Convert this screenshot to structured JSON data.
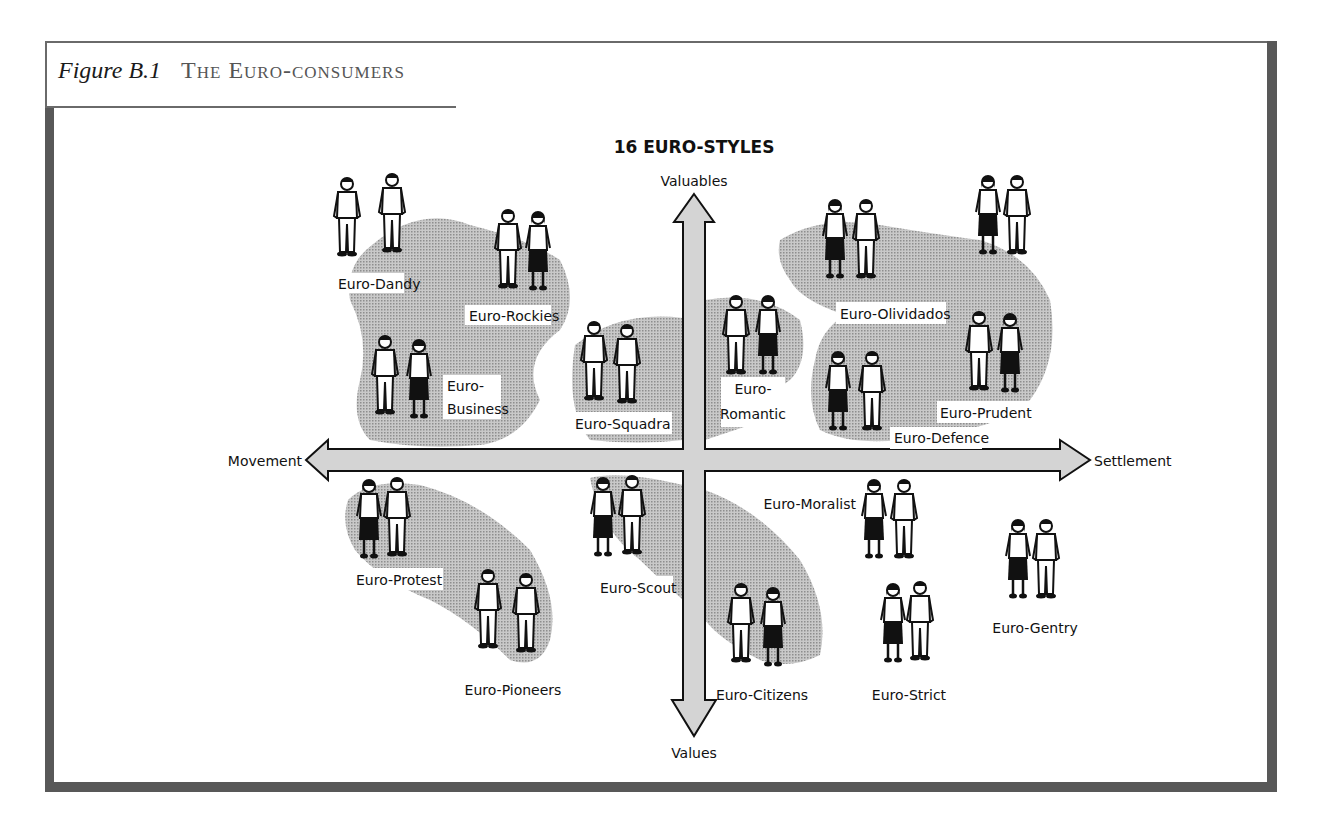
{
  "figure": {
    "number": "Figure B.1",
    "title": "The Euro-consumers"
  },
  "diagram": {
    "title": "16 EURO-STYLES",
    "axes": {
      "top": "Valuables",
      "bottom": "Values",
      "left": "Movement",
      "right": "Settlement"
    },
    "colors": {
      "arrow_fill": "#d4d4d4",
      "arrow_stroke": "#111111",
      "blob_fill": "#b5b5b5",
      "frame": "#585858"
    },
    "groups": [
      {
        "label": "Euro-Dandy",
        "quadrant": "top-left"
      },
      {
        "label": "Euro-Rockies",
        "quadrant": "top-left"
      },
      {
        "label_line1": "Euro-",
        "label_line2": "Business",
        "quadrant": "top-left"
      },
      {
        "label": "Euro-Squadra",
        "quadrant": "top-left"
      },
      {
        "label_line1": "Euro-",
        "label_line2": "Romantic",
        "quadrant": "top-right"
      },
      {
        "label": "Euro-Olividados",
        "quadrant": "top-right"
      },
      {
        "label": "Euro-Defence",
        "quadrant": "top-right"
      },
      {
        "label": "Euro-Prudent",
        "quadrant": "top-right"
      },
      {
        "label": "Euro-Protest",
        "quadrant": "bottom-left"
      },
      {
        "label": "Euro-Pioneers",
        "quadrant": "bottom-left"
      },
      {
        "label": "Euro-Scout",
        "quadrant": "bottom-left"
      },
      {
        "label": "Euro-Citizens",
        "quadrant": "bottom-right"
      },
      {
        "label": "Euro-Moralist",
        "quadrant": "bottom-right"
      },
      {
        "label": "Euro-Strict",
        "quadrant": "bottom-right"
      },
      {
        "label": "Euro-Gentry",
        "quadrant": "bottom-right"
      }
    ]
  }
}
